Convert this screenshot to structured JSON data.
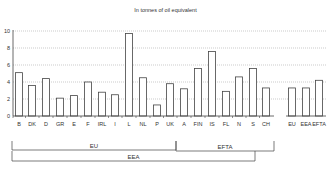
{
  "chart_data": {
    "type": "bar",
    "title": "In tonnes of oil equivalent",
    "xlabel": "",
    "ylabel": "",
    "ylim": [
      0,
      10
    ],
    "yticks": [
      0,
      2,
      4,
      6,
      8,
      10
    ],
    "grid": true,
    "legend": null,
    "categories": [
      "B",
      "DK",
      "D",
      "GR",
      "E",
      "F",
      "IRL",
      "I",
      "L",
      "NL",
      "P",
      "UK",
      "A",
      "FIN",
      "IS",
      "FL",
      "N",
      "S",
      "CH",
      "EU",
      "EEA",
      "EFTA"
    ],
    "values": [
      5.1,
      3.6,
      4.4,
      2.1,
      2.4,
      4.0,
      2.8,
      2.5,
      9.7,
      4.5,
      1.3,
      3.8,
      3.2,
      5.6,
      7.6,
      2.9,
      4.6,
      5.6,
      3.3,
      3.3,
      3.3,
      4.2
    ],
    "groups": [
      {
        "label": "EU",
        "from": "B",
        "to": "A"
      },
      {
        "label": "EFTA",
        "from": "FIN",
        "to": "CH"
      },
      {
        "label": "EEA",
        "from": "B",
        "to": "S"
      }
    ]
  }
}
